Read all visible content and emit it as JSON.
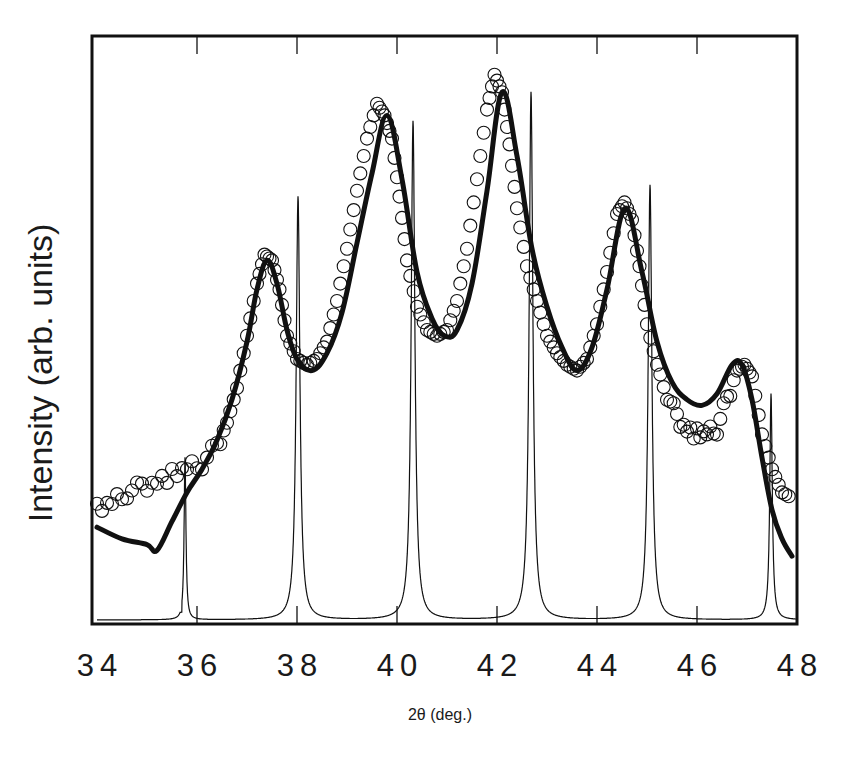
{
  "chart_data": {
    "type": "line",
    "title": "",
    "xlabel": "2θ (deg.)",
    "ylabel": "Intensity (arb. units)",
    "xlim": [
      34,
      48
    ],
    "ylim": [
      0,
      1
    ],
    "x_ticks": [
      34,
      36,
      38,
      40,
      42,
      44,
      46,
      48
    ],
    "x_tick_labels": [
      "34",
      "36",
      "38",
      "40",
      "42",
      "44",
      "46",
      "48"
    ],
    "y_ticks": [],
    "grid": false,
    "legend": null,
    "colors": {
      "line": "#111111",
      "frame": "#111111",
      "background": "#ffffff"
    },
    "series": [
      {
        "name": "measured (open circles)",
        "style": "markers-open-circle",
        "x": [
          34.0,
          34.3,
          34.6,
          34.9,
          35.2,
          35.5,
          35.8,
          36.1,
          36.4,
          36.6,
          36.8,
          37.0,
          37.2,
          37.35,
          37.5,
          37.65,
          37.8,
          38.0,
          38.2,
          38.4,
          38.6,
          38.8,
          39.0,
          39.2,
          39.4,
          39.6,
          39.75,
          39.9,
          40.05,
          40.2,
          40.4,
          40.6,
          40.8,
          41.0,
          41.2,
          41.4,
          41.6,
          41.8,
          41.95,
          42.1,
          42.25,
          42.4,
          42.6,
          42.8,
          43.0,
          43.2,
          43.4,
          43.6,
          43.8,
          44.0,
          44.2,
          44.4,
          44.55,
          44.7,
          44.85,
          45.0,
          45.2,
          45.4,
          45.6,
          45.8,
          46.0,
          46.2,
          46.4,
          46.6,
          46.8,
          46.95,
          47.1,
          47.3,
          47.5,
          47.7,
          47.9
        ],
        "y": [
          0.19,
          0.2,
          0.22,
          0.23,
          0.24,
          0.25,
          0.26,
          0.27,
          0.3,
          0.34,
          0.4,
          0.49,
          0.58,
          0.63,
          0.62,
          0.57,
          0.49,
          0.45,
          0.44,
          0.45,
          0.48,
          0.55,
          0.64,
          0.74,
          0.83,
          0.89,
          0.87,
          0.83,
          0.73,
          0.62,
          0.54,
          0.5,
          0.49,
          0.5,
          0.55,
          0.64,
          0.76,
          0.88,
          0.94,
          0.91,
          0.82,
          0.71,
          0.61,
          0.55,
          0.49,
          0.46,
          0.44,
          0.43,
          0.45,
          0.51,
          0.6,
          0.7,
          0.72,
          0.69,
          0.61,
          0.51,
          0.44,
          0.39,
          0.35,
          0.33,
          0.32,
          0.32,
          0.33,
          0.38,
          0.43,
          0.44,
          0.42,
          0.32,
          0.26,
          0.22,
          0.21
        ]
      },
      {
        "name": "calculated fit (thick line)",
        "style": "line-thick",
        "x": [
          34.0,
          34.5,
          35.0,
          35.2,
          35.5,
          35.8,
          36.1,
          36.4,
          36.7,
          37.0,
          37.2,
          37.4,
          37.6,
          37.8,
          38.0,
          38.3,
          38.6,
          38.9,
          39.2,
          39.5,
          39.8,
          40.1,
          40.4,
          40.7,
          40.95,
          41.2,
          41.5,
          41.8,
          42.1,
          42.4,
          42.7,
          43.0,
          43.3,
          43.6,
          43.9,
          44.2,
          44.56,
          44.9,
          45.2,
          45.5,
          45.8,
          46.1,
          46.4,
          46.7,
          46.9,
          47.1,
          47.3,
          47.5,
          47.7,
          47.9
        ],
        "y": [
          0.16,
          0.14,
          0.13,
          0.12,
          0.17,
          0.22,
          0.26,
          0.31,
          0.38,
          0.48,
          0.57,
          0.62,
          0.58,
          0.5,
          0.45,
          0.43,
          0.46,
          0.53,
          0.65,
          0.77,
          0.87,
          0.76,
          0.6,
          0.52,
          0.49,
          0.5,
          0.58,
          0.74,
          0.91,
          0.8,
          0.64,
          0.54,
          0.47,
          0.43,
          0.47,
          0.57,
          0.71,
          0.6,
          0.48,
          0.41,
          0.38,
          0.37,
          0.39,
          0.44,
          0.44,
          0.38,
          0.28,
          0.19,
          0.14,
          0.11
        ]
      },
      {
        "name": "reference (thin line, sharp peaks)",
        "style": "line-thin",
        "peaks": [
          {
            "x": 35.76,
            "y": 0.28
          },
          {
            "x": 38.02,
            "y": 0.73
          },
          {
            "x": 40.32,
            "y": 0.86
          },
          {
            "x": 42.68,
            "y": 0.91
          },
          {
            "x": 45.06,
            "y": 0.75
          },
          {
            "x": 47.48,
            "y": 0.39
          }
        ],
        "valleys": [
          {
            "x": 35.0,
            "y": 0.0
          },
          {
            "x": 36.6,
            "y": 0.035
          },
          {
            "x": 39.2,
            "y": 0.065
          },
          {
            "x": 41.5,
            "y": 0.068
          },
          {
            "x": 43.9,
            "y": 0.065
          },
          {
            "x": 46.3,
            "y": 0.04
          },
          {
            "x": 47.9,
            "y": 0.007
          }
        ]
      }
    ]
  },
  "axes": {
    "x_label": "2θ (deg.)",
    "y_label": "Intensity (arb. units)",
    "ticks": [
      "34",
      "36",
      "38",
      "40",
      "42",
      "44",
      "46",
      "48"
    ]
  }
}
